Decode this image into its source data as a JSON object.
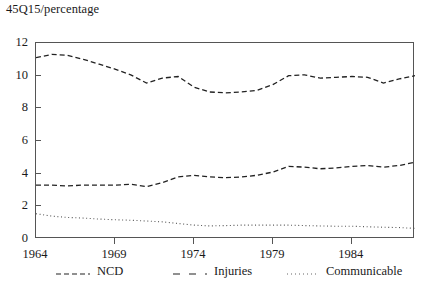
{
  "chart_data": {
    "type": "line",
    "title": "45Q15/percentage",
    "xlabel": "",
    "ylabel": "",
    "xlim": [
      1964,
      1988
    ],
    "ylim": [
      0,
      12
    ],
    "grid": false,
    "legend_position": "bottom",
    "y_ticks": [
      0,
      2,
      4,
      6,
      8,
      10,
      12
    ],
    "y_tick_labels": [
      "0",
      "2",
      "4",
      "6",
      "8",
      "10",
      "12"
    ],
    "x_ticks": [
      1964,
      1969,
      1974,
      1979,
      1984
    ],
    "x_tick_labels": [
      "1964",
      "1969",
      "1974",
      "1979",
      "1984"
    ],
    "x": [
      1964,
      1965,
      1966,
      1967,
      1968,
      1969,
      1970,
      1971,
      1972,
      1973,
      1974,
      1975,
      1976,
      1977,
      1978,
      1979,
      1980,
      1981,
      1982,
      1983,
      1984,
      1985,
      1986,
      1987,
      1988
    ],
    "series": [
      {
        "name": "NCD",
        "linestyle": "dashed",
        "color": "#222222",
        "values": [
          11.1,
          11.3,
          11.25,
          11.0,
          10.7,
          10.4,
          10.05,
          9.55,
          9.85,
          9.95,
          9.3,
          9.0,
          8.95,
          9.0,
          9.1,
          9.45,
          10.0,
          10.05,
          9.85,
          9.9,
          9.95,
          9.9,
          9.55,
          9.8,
          10.0
        ]
      },
      {
        "name": "Injuries",
        "linestyle": "dashed",
        "color": "#222222",
        "values": [
          3.3,
          3.3,
          3.25,
          3.3,
          3.3,
          3.3,
          3.35,
          3.2,
          3.45,
          3.8,
          3.9,
          3.8,
          3.75,
          3.8,
          3.9,
          4.1,
          4.45,
          4.4,
          4.3,
          4.35,
          4.45,
          4.5,
          4.4,
          4.5,
          4.7
        ]
      },
      {
        "name": "Communicable",
        "linestyle": "dotted",
        "color": "#555555",
        "values": [
          1.55,
          1.4,
          1.32,
          1.28,
          1.22,
          1.18,
          1.15,
          1.1,
          1.05,
          0.95,
          0.85,
          0.8,
          0.82,
          0.85,
          0.85,
          0.85,
          0.85,
          0.82,
          0.8,
          0.78,
          0.78,
          0.75,
          0.72,
          0.7,
          0.65
        ]
      }
    ]
  },
  "legend": {
    "items": [
      {
        "label": "NCD"
      },
      {
        "label": "Injuries"
      },
      {
        "label": "Communicable"
      }
    ]
  }
}
